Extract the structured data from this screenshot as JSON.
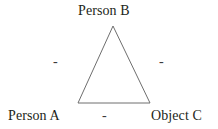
{
  "diagram": {
    "type": "balance-theory-triangle",
    "background_color": "#ffffff",
    "line_color": "#6e6e6e",
    "text_color": "#231f20",
    "nodes": [
      {
        "id": "B",
        "label": "Person B",
        "position": "top-apex"
      },
      {
        "id": "A",
        "label": "Person A",
        "position": "bottom-left"
      },
      {
        "id": "C",
        "label": "Object C",
        "position": "bottom-right"
      }
    ],
    "edges": [
      {
        "id": "AB",
        "label": "-",
        "sign": "negative",
        "from": "A",
        "to": "B",
        "position": "left"
      },
      {
        "id": "BC",
        "label": "-",
        "sign": "negative",
        "from": "B",
        "to": "C",
        "position": "right"
      },
      {
        "id": "AC",
        "label": "-",
        "sign": "negative",
        "from": "A",
        "to": "C",
        "position": "bottom"
      }
    ],
    "geometry": {
      "apex": [
        113,
        26
      ],
      "bottom_left": [
        78,
        103
      ],
      "bottom_right": [
        150,
        103
      ],
      "stroke_width": 1
    }
  }
}
